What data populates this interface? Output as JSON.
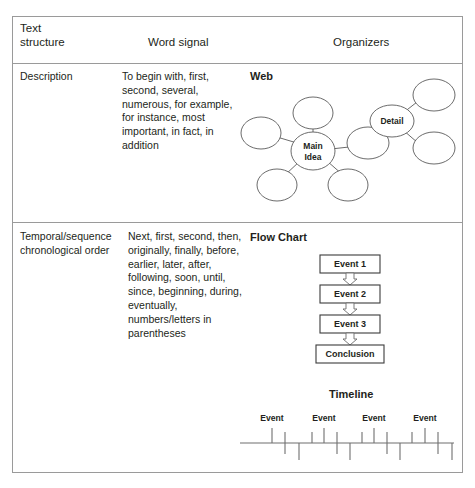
{
  "table": {
    "headers": {
      "text_structure": "Text\nstructure",
      "word_signal": "Word signal",
      "organizers": "Organizers"
    },
    "rows": [
      {
        "structure": "Description",
        "signals": "To begin with, first, second, several, numerous, for example, for instance, most important, in fact, in addition",
        "organizer_title": "Web"
      },
      {
        "structure": "Temporal/sequence chronological order",
        "signals": "Next, first, second, then, originally, finally, before, earlier, later, after, following, soon, until, since, beginning, during, eventually, numbers/letters in parentheses",
        "organizer_title": "Flow Chart",
        "organizer_title_2": "Timeline"
      }
    ]
  },
  "web": {
    "center_label": "Main\nIdea",
    "center_line_1": "Main",
    "center_line_2": "Idea",
    "detail_label": "Detail",
    "blank_node_count": 7
  },
  "flow_chart": {
    "steps": [
      {
        "label": "Event 1"
      },
      {
        "label": "Event 2"
      },
      {
        "label": "Event 3"
      },
      {
        "label": "Conclusion"
      }
    ]
  },
  "timeline": {
    "title": "Timeline",
    "event_labels": [
      "Event",
      "Event",
      "Event",
      "Event"
    ],
    "tick_count_above": 12,
    "tick_count_below": 8
  },
  "colors": {
    "border": "#9a9a9a",
    "stroke": "#5a5a5a",
    "text": "#231f20",
    "background": "#ffffff"
  }
}
